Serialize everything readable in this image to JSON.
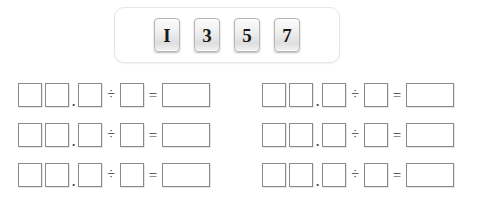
{
  "tray": {
    "name": "number-tile-tray",
    "tiles": [
      {
        "label": "1",
        "glyph": "I"
      },
      {
        "label": "3",
        "glyph": "3"
      },
      {
        "label": "5",
        "glyph": "5"
      },
      {
        "label": "7",
        "glyph": "7"
      }
    ]
  },
  "operators": {
    "decimal": ".",
    "divide": "÷",
    "equals": "="
  },
  "worksheet": {
    "columns": [
      {
        "name": "left-column",
        "rows": [
          {
            "whole1": "",
            "whole2": "",
            "decimal_digit": "",
            "divisor": "",
            "answer": ""
          },
          {
            "whole1": "",
            "whole2": "",
            "decimal_digit": "",
            "divisor": "",
            "answer": ""
          },
          {
            "whole1": "",
            "whole2": "",
            "decimal_digit": "",
            "divisor": "",
            "answer": ""
          }
        ]
      },
      {
        "name": "right-column",
        "rows": [
          {
            "whole1": "",
            "whole2": "",
            "decimal_digit": "",
            "divisor": "",
            "answer": ""
          },
          {
            "whole1": "",
            "whole2": "",
            "decimal_digit": "",
            "divisor": "",
            "answer": ""
          },
          {
            "whole1": "",
            "whole2": "",
            "decimal_digit": "",
            "divisor": "",
            "answer": ""
          }
        ]
      }
    ]
  },
  "colors": {
    "box_border": "#8a8a8a",
    "tray_border": "#e6e6e6",
    "tile_text": "#1a1a1a",
    "background": "#ffffff"
  }
}
